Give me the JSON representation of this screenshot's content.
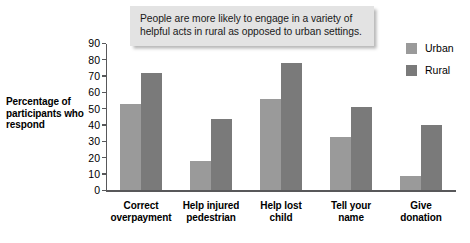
{
  "callout": {
    "text": "People are more likely to engage in a variety of helpful acts in rural as opposed to urban settings."
  },
  "legend": {
    "position": "right",
    "items": [
      {
        "label": "Urban",
        "color": "#9a9a9a"
      },
      {
        "label": "Rural",
        "color": "#7a7a7a"
      }
    ]
  },
  "axis": {
    "ylabel": "Percentage of participants who respond",
    "yticks": [
      "90",
      "80",
      "70",
      "60",
      "50",
      "40",
      "30",
      "20",
      "10",
      "0"
    ]
  },
  "chart_data": {
    "type": "bar",
    "title": "",
    "xlabel": "",
    "ylabel": "Percentage of participants who respond",
    "ylim": [
      0,
      90
    ],
    "ytick_step": 10,
    "grid": false,
    "legend_position": "right",
    "annotations": [
      "People are more likely to engage in a variety of helpful acts in rural as opposed to urban settings."
    ],
    "categories": [
      "Correct overpayment",
      "Help injured pedestrian",
      "Help lost child",
      "Tell your name",
      "Give donation"
    ],
    "category_lines": [
      [
        "Correct",
        "overpayment"
      ],
      [
        "Help injured",
        "pedestrian"
      ],
      [
        "Help lost",
        "child"
      ],
      [
        "Tell your",
        "name"
      ],
      [
        "Give",
        "donation"
      ]
    ],
    "series": [
      {
        "name": "Urban",
        "color": "#9a9a9a",
        "values": [
          53,
          18,
          56,
          33,
          9
        ]
      },
      {
        "name": "Rural",
        "color": "#7a7a7a",
        "values": [
          72,
          44,
          78,
          51,
          40
        ]
      }
    ]
  }
}
